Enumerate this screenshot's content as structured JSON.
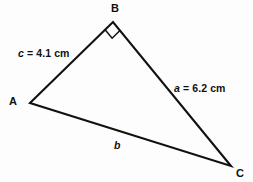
{
  "figure": {
    "type": "right-triangle-diagram",
    "background_color": "#fdfdfd",
    "stroke_color": "#111111",
    "text_color": "#111111",
    "vertices": {
      "A": {
        "label": "A",
        "x": 30,
        "y": 103
      },
      "B": {
        "label": "B",
        "x": 113,
        "y": 22
      },
      "C": {
        "label": "C",
        "x": 231,
        "y": 166
      }
    },
    "right_angle": {
      "at_vertex": "B",
      "marker": "square",
      "size": 11
    },
    "sides": {
      "c": {
        "var": "c",
        "between": "A-B",
        "value": "4.1",
        "unit": "cm",
        "label_var": "c",
        "label_rest": " = 4.1 cm"
      },
      "a": {
        "var": "a",
        "between": "B-C",
        "value": "6.2",
        "unit": "cm",
        "label_var": "a",
        "label_rest": " = 6.2 cm"
      },
      "b": {
        "var": "b",
        "between": "A-C",
        "value": "",
        "unit": "",
        "label_var": "b",
        "label_rest": ""
      }
    }
  }
}
